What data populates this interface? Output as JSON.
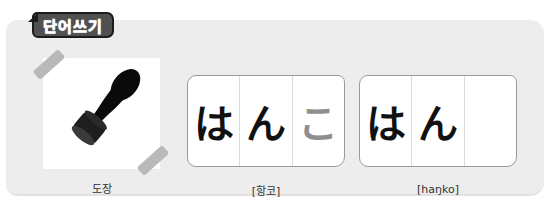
{
  "section": {
    "badge_label": "단어쓰기"
  },
  "word": {
    "image_icon": "stamp-icon",
    "meaning": "도장",
    "pronunciation_korean": "[항코]",
    "pronunciation_roman": "[haŋko]"
  },
  "cards": [
    {
      "cells": [
        {
          "char": "は",
          "style": "solid"
        },
        {
          "char": "ん",
          "style": "solid"
        },
        {
          "char": "こ",
          "style": "trace"
        }
      ]
    },
    {
      "cells": [
        {
          "char": "は",
          "style": "solid"
        },
        {
          "char": "ん",
          "style": "solid"
        },
        {
          "char": "",
          "style": "empty"
        }
      ]
    }
  ],
  "colors": {
    "panel": "#ededed",
    "badge": "#505050",
    "tape": "#b9b9b9",
    "trace_text": "#8f8f8f"
  }
}
